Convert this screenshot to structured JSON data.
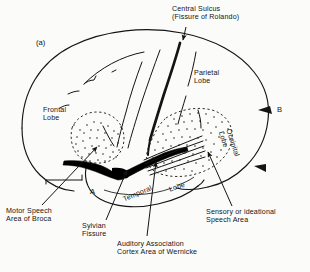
{
  "figure": {
    "marker": "(a)",
    "point_a": "A",
    "point_b": "B"
  },
  "callouts": {
    "central_sulcus": "Central Sulcus\n(Fissure of Rolando)",
    "motor_speech": "Motor Speech\nArea of Broca",
    "sylvian_fissure": "Sylvian\nFissure",
    "auditory_association": "Auditory Association\nCortex Area of Wernicke",
    "sensory_speech": "Sensory or ideational\nSpeech Area"
  },
  "lobes": {
    "frontal": "Frontal\nLobe",
    "parietal": "Parietal\nLobe",
    "occipital": "Occipital\nLobe",
    "temporal": "Temporal",
    "temporal_suffix": "Lobe"
  },
  "colors": {
    "ink": "#141414",
    "background": "#fbfbfa",
    "fissure_fill": "#000000"
  }
}
